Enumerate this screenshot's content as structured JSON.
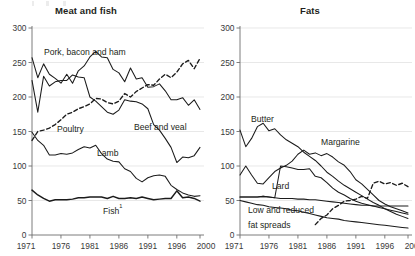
{
  "charts": {
    "left": {
      "title": "Meat and fish",
      "yticks": [
        "0",
        "50",
        "100",
        "150",
        "200",
        "250",
        "300"
      ],
      "xticks": [
        "1971",
        "1976",
        "1981",
        "1986",
        "1991",
        "1996",
        "2000"
      ],
      "labels": {
        "pork": "Pork, bacon and ham",
        "poultry": "Poultry",
        "beef": "Beef and veal",
        "lamb": "Lamb",
        "fish": "Fish",
        "fish_footnote": "1"
      }
    },
    "right": {
      "title": "Fats",
      "yticks": [
        "0",
        "50",
        "100",
        "150",
        "200",
        "250",
        "300"
      ],
      "xticks": [
        "1971",
        "1976",
        "1981",
        "1986",
        "1991",
        "1996",
        "2000"
      ],
      "labels": {
        "butter": "Butter",
        "margarine": "Margarine",
        "lard": "Lard",
        "lowfat_line1": "Low and reduced",
        "lowfat_line2": "fat spreads"
      }
    }
  },
  "colors": {
    "line": "#1b1b1b",
    "grid": "#d8d8d8",
    "axis": "#6e6e6e",
    "text": "#231f20"
  },
  "chart_data": [
    {
      "type": "line",
      "title": "Meat and fish",
      "xlabel": "",
      "ylabel": "",
      "xlim": [
        1971,
        2000
      ],
      "ylim": [
        0,
        300
      ],
      "ytick_values": [
        0,
        50,
        100,
        150,
        200,
        250,
        300
      ],
      "xtick_values": [
        1971,
        1976,
        1981,
        1986,
        1991,
        1996,
        2000
      ],
      "grid": true,
      "legend": "inline-labels",
      "x": [
        1971,
        1972,
        1973,
        1974,
        1975,
        1976,
        1977,
        1978,
        1979,
        1980,
        1981,
        1982,
        1983,
        1984,
        1985,
        1986,
        1987,
        1988,
        1989,
        1990,
        1991,
        1992,
        1993,
        1994,
        1995,
        1996,
        1997,
        1998,
        1999,
        2000
      ],
      "series": [
        {
          "name": "Pork, bacon and ham",
          "style": "solid",
          "values": [
            257,
            228,
            248,
            233,
            227,
            220,
            233,
            220,
            238,
            245,
            258,
            266,
            258,
            257,
            240,
            235,
            222,
            242,
            226,
            228,
            214,
            215,
            219,
            209,
            196,
            196,
            199,
            188,
            196,
            182
          ]
        },
        {
          "name": "Poultry",
          "style": "dashed",
          "values": [
            137,
            150,
            152,
            155,
            160,
            167,
            175,
            178,
            183,
            186,
            190,
            198,
            197,
            192,
            190,
            194,
            205,
            200,
            208,
            213,
            218,
            217,
            226,
            233,
            228,
            236,
            248,
            253,
            241,
            256
          ]
        },
        {
          "name": "Beef and veal",
          "style": "solid",
          "values": [
            224,
            178,
            230,
            216,
            222,
            224,
            224,
            232,
            229,
            228,
            200,
            194,
            186,
            178,
            175,
            181,
            196,
            194,
            193,
            190,
            183,
            160,
            152,
            140,
            127,
            105,
            113,
            112,
            115,
            127
          ]
        },
        {
          "name": "Lamb",
          "style": "solid",
          "values": [
            149,
            137,
            130,
            116,
            116,
            118,
            117,
            119,
            124,
            128,
            126,
            130,
            118,
            110,
            107,
            106,
            96,
            92,
            82,
            77,
            83,
            86,
            87,
            85,
            72,
            66,
            61,
            58,
            56,
            57
          ]
        },
        {
          "name": "Fish",
          "style": "thick",
          "values": [
            65,
            58,
            53,
            49,
            51,
            51,
            51,
            52,
            54,
            54,
            55,
            55,
            55,
            53,
            56,
            53,
            53,
            54,
            53,
            55,
            53,
            51,
            52,
            53,
            53,
            64,
            54,
            55,
            53,
            49
          ]
        }
      ]
    },
    {
      "type": "line",
      "title": "Fats",
      "xlabel": "",
      "ylabel": "",
      "xlim": [
        1971,
        2000
      ],
      "ylim": [
        0,
        300
      ],
      "ytick_values": [
        0,
        50,
        100,
        150,
        200,
        250,
        300
      ],
      "xtick_values": [
        1971,
        1976,
        1981,
        1986,
        1991,
        1996,
        2000
      ],
      "grid": true,
      "legend": "inline-labels",
      "x": [
        1971,
        1972,
        1973,
        1974,
        1975,
        1976,
        1977,
        1978,
        1979,
        1980,
        1981,
        1982,
        1983,
        1984,
        1985,
        1986,
        1987,
        1988,
        1989,
        1990,
        1991,
        1992,
        1993,
        1994,
        1995,
        1996,
        1997,
        1998,
        1999,
        2000
      ],
      "series": [
        {
          "name": "Butter",
          "style": "solid",
          "values": [
            152,
            128,
            140,
            157,
            162,
            151,
            154,
            145,
            138,
            133,
            128,
            120,
            114,
            108,
            100,
            91,
            85,
            78,
            72,
            67,
            62,
            57,
            52,
            47,
            43,
            38,
            34,
            30,
            27,
            24
          ]
        },
        {
          "name": "Margarine",
          "style": "solid",
          "values": [
            87,
            100,
            87,
            75,
            74,
            83,
            92,
            97,
            101,
            107,
            117,
            123,
            117,
            119,
            115,
            118,
            113,
            106,
            101,
            92,
            80,
            74,
            66,
            58,
            50,
            45,
            41,
            38,
            35,
            32
          ]
        },
        {
          "name": "Lard",
          "style": "solid",
          "values": [
            55,
            55,
            55,
            55,
            56,
            55,
            54,
            100,
            99,
            97,
            95,
            95,
            96,
            85,
            83,
            76,
            68,
            62,
            58,
            53,
            49,
            46,
            44,
            42,
            40,
            38,
            36,
            34,
            32,
            30
          ]
        },
        {
          "name": "Low and reduced fat spreads",
          "style": "dashed",
          "values": [
            null,
            null,
            null,
            null,
            null,
            null,
            null,
            null,
            null,
            null,
            null,
            null,
            null,
            15,
            24,
            29,
            38,
            43,
            49,
            50,
            52,
            56,
            53,
            75,
            78,
            74,
            76,
            72,
            75,
            70
          ]
        },
        {
          "name": "Total fats baseline",
          "style": "solid",
          "values": [
            55,
            55,
            55,
            55,
            56,
            55,
            54,
            53,
            53,
            53,
            52,
            52,
            51,
            51,
            50,
            49,
            48,
            47,
            46,
            45,
            44,
            43,
            43,
            42,
            42,
            42,
            42,
            42,
            42,
            42
          ]
        },
        {
          "name": "Other fats",
          "style": "solid",
          "values": [
            50,
            48,
            46,
            44,
            43,
            41,
            40,
            39,
            38,
            36,
            35,
            33,
            31,
            29,
            27,
            25,
            24,
            23,
            21,
            20,
            19,
            18,
            17,
            16,
            15,
            14,
            13,
            12,
            11,
            10
          ]
        }
      ]
    }
  ]
}
